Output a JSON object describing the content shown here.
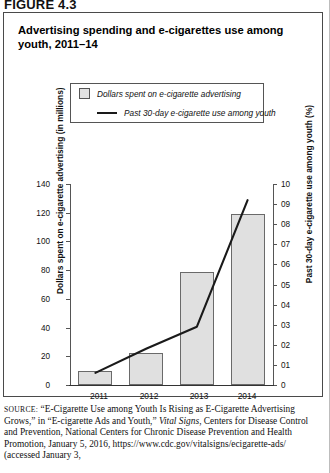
{
  "figure": {
    "label": "FIGURE 4.3"
  },
  "chart_title": "Advertising spending and e-cigarettes use among youth, 2011–14",
  "legend": {
    "bar_entry": "Dollars spent on e-cigarette advertising",
    "line_entry": "Past 30-day e-cigarette use among youth"
  },
  "axes": {
    "left_label": "Dollars spent on e-cigarette advertising (in millions)",
    "right_label": "Past 30-day e-cigarette use among youth (%)",
    "left_ticks": [
      "0",
      "20",
      "40",
      "60",
      "80",
      "100",
      "120",
      "140"
    ],
    "right_ticks": [
      "0",
      "01",
      "02",
      "03",
      "04",
      "05",
      "06",
      "07",
      "08",
      "09",
      "10"
    ]
  },
  "source": {
    "prefix": "SOURCE:",
    "line1": " “E-Cigarette Use among Youth Is Rising as E-Cigarette",
    "line2": "Advertising Grows,” in “E-cigarette Ads and Youth,” ",
    "italic1": "Vital Signs",
    "line3": ", Centers for Disease Control and Prevention, National Centers for Chronic Disease Prevention and Health Promotion, January 5, 2016, https://www.cdc.gov/vitalsigns/ecigarette-ads/ (accessed January 3,"
  },
  "chart_data": {
    "type": "bar",
    "title": "Advertising spending and e-cigarettes use among youth, 2011–14",
    "categories": [
      "2011",
      "2012",
      "2013",
      "2014"
    ],
    "xlabel": "",
    "grid": false,
    "legend_position": "top-center",
    "series": [
      {
        "name": "Dollars spent on e-cigarette advertising",
        "type": "bar",
        "axis": "left",
        "unit": "millions of dollars",
        "values": [
          10,
          22,
          79,
          119
        ]
      },
      {
        "name": "Past 30-day e-cigarette use among youth",
        "type": "line",
        "axis": "right",
        "unit": "percent",
        "values": [
          0.6,
          1.8,
          2.9,
          9.2
        ]
      }
    ],
    "ylabel": "Dollars spent on e-cigarette advertising (in millions)",
    "ylim": [
      0,
      140
    ],
    "y2label": "Past 30-day e-cigarette use among youth (%)",
    "y2lim": [
      0,
      10
    ]
  }
}
